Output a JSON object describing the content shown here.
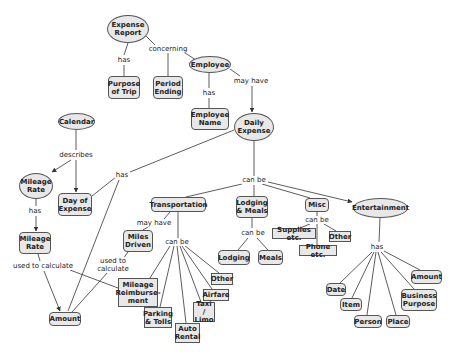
{
  "diagram": {
    "colors": {
      "node_fill": "#e8e8e8",
      "node_border": "#555555",
      "line": "#333333",
      "background": "#ffffff"
    },
    "nodes": [
      {
        "id": "expense_report",
        "label": "Expense\nReport",
        "shape": "oval",
        "x": 107,
        "y": 15,
        "w": 42,
        "h": 28
      },
      {
        "id": "purpose_of_trip",
        "label": "Purpose\nof Trip",
        "shape": "round",
        "x": 108,
        "y": 76,
        "w": 32,
        "h": 23
      },
      {
        "id": "period_ending",
        "label": "Period\nEnding",
        "shape": "round",
        "x": 153,
        "y": 76,
        "w": 30,
        "h": 23
      },
      {
        "id": "employee",
        "label": "Employee",
        "shape": "oval",
        "x": 189,
        "y": 56,
        "w": 42,
        "h": 17
      },
      {
        "id": "employee_name",
        "label": "Employee\nName",
        "shape": "round",
        "x": 191,
        "y": 108,
        "w": 38,
        "h": 22
      },
      {
        "id": "daily_expense",
        "label": "Daily\nExpense",
        "shape": "oval",
        "x": 234,
        "y": 113,
        "w": 40,
        "h": 28
      },
      {
        "id": "calendar",
        "label": "Calendar",
        "shape": "oval",
        "x": 58,
        "y": 113,
        "w": 37,
        "h": 17
      },
      {
        "id": "mileage_rate_oval",
        "label": "Mileage\nRate",
        "shape": "oval",
        "x": 19,
        "y": 173,
        "w": 34,
        "h": 26
      },
      {
        "id": "day_of_expense",
        "label": "Day of\nExpense",
        "shape": "round",
        "x": 58,
        "y": 193,
        "w": 34,
        "h": 23
      },
      {
        "id": "mileage_rate_box",
        "label": "Mileage\nRate",
        "shape": "round",
        "x": 19,
        "y": 232,
        "w": 32,
        "h": 22
      },
      {
        "id": "amount_left",
        "label": "Amount",
        "shape": "round",
        "x": 49,
        "y": 312,
        "w": 32,
        "h": 14
      },
      {
        "id": "transportation",
        "label": "Transportation",
        "shape": "round",
        "x": 151,
        "y": 197,
        "w": 55,
        "h": 15
      },
      {
        "id": "miles_driven",
        "label": "Miles\nDriven",
        "shape": "round",
        "x": 123,
        "y": 230,
        "w": 30,
        "h": 22
      },
      {
        "id": "mileage_reimbursement",
        "label": "Mileage\nReimburse-\nment",
        "shape": "square",
        "x": 118,
        "y": 278,
        "w": 40,
        "h": 29
      },
      {
        "id": "parking_tolls",
        "label": "Parking\n& Tolls",
        "shape": "square",
        "x": 144,
        "y": 307,
        "w": 28,
        "h": 21
      },
      {
        "id": "auto_rental",
        "label": "Auto\nRental",
        "shape": "square",
        "x": 175,
        "y": 323,
        "w": 25,
        "h": 20
      },
      {
        "id": "taxi_limo",
        "label": "Taxi /\nLimo",
        "shape": "square",
        "x": 193,
        "y": 302,
        "w": 22,
        "h": 20
      },
      {
        "id": "airfare",
        "label": "Airfare",
        "shape": "square",
        "x": 203,
        "y": 289,
        "w": 26,
        "h": 12
      },
      {
        "id": "other_transport",
        "label": "Other",
        "shape": "square",
        "x": 211,
        "y": 273,
        "w": 22,
        "h": 12
      },
      {
        "id": "lodging_meals",
        "label": "Lodging\n& Meals",
        "shape": "round",
        "x": 236,
        "y": 196,
        "w": 32,
        "h": 22
      },
      {
        "id": "lodging",
        "label": "Lodging",
        "shape": "round",
        "x": 218,
        "y": 250,
        "w": 32,
        "h": 15
      },
      {
        "id": "meals",
        "label": "Meals",
        "shape": "round",
        "x": 258,
        "y": 250,
        "w": 25,
        "h": 15
      },
      {
        "id": "misc",
        "label": "Misc",
        "shape": "round",
        "x": 305,
        "y": 198,
        "w": 24,
        "h": 14
      },
      {
        "id": "supplies",
        "label": "Supplies etc.",
        "shape": "square",
        "x": 272,
        "y": 228,
        "w": 44,
        "h": 11
      },
      {
        "id": "phone",
        "label": "Phone etc.",
        "shape": "square",
        "x": 299,
        "y": 245,
        "w": 38,
        "h": 11
      },
      {
        "id": "other_misc",
        "label": "Other",
        "shape": "square",
        "x": 329,
        "y": 231,
        "w": 22,
        "h": 11
      },
      {
        "id": "entertainment",
        "label": "Entertainment",
        "shape": "oval",
        "x": 353,
        "y": 198,
        "w": 55,
        "h": 20
      },
      {
        "id": "date",
        "label": "Date",
        "shape": "round",
        "x": 326,
        "y": 283,
        "w": 20,
        "h": 13
      },
      {
        "id": "item",
        "label": "Item",
        "shape": "round",
        "x": 340,
        "y": 298,
        "w": 22,
        "h": 13
      },
      {
        "id": "person",
        "label": "Person",
        "shape": "round",
        "x": 354,
        "y": 315,
        "w": 28,
        "h": 13
      },
      {
        "id": "place",
        "label": "Place",
        "shape": "round",
        "x": 386,
        "y": 315,
        "w": 24,
        "h": 13
      },
      {
        "id": "business_purpose",
        "label": "Business\nPurpose",
        "shape": "round",
        "x": 401,
        "y": 289,
        "w": 36,
        "h": 22
      },
      {
        "id": "amount_right",
        "label": "Amount",
        "shape": "round",
        "x": 411,
        "y": 270,
        "w": 31,
        "h": 14
      }
    ],
    "link_labels": [
      {
        "id": "lbl_has_1",
        "text": "has",
        "x": 124,
        "y": 60
      },
      {
        "id": "lbl_concerning",
        "text": "concerning",
        "x": 168,
        "y": 49
      },
      {
        "id": "lbl_has_2",
        "text": "has",
        "x": 209,
        "y": 93
      },
      {
        "id": "lbl_may_have_1",
        "text": "may have",
        "x": 251,
        "y": 81
      },
      {
        "id": "lbl_describes",
        "text": "describes",
        "x": 76,
        "y": 155
      },
      {
        "id": "lbl_has_3",
        "text": "has",
        "x": 122,
        "y": 175
      },
      {
        "id": "lbl_has_4",
        "text": "has",
        "x": 35,
        "y": 211
      },
      {
        "id": "lbl_used_to_calc_1",
        "text": "used to calculate",
        "x": 43,
        "y": 266
      },
      {
        "id": "lbl_can_be_1",
        "text": "can be",
        "x": 254,
        "y": 180
      },
      {
        "id": "lbl_may_have_2",
        "text": "may have",
        "x": 154,
        "y": 223
      },
      {
        "id": "lbl_used_to_calc_2",
        "text": "used to\ncalculate",
        "x": 113,
        "y": 265
      },
      {
        "id": "lbl_can_be_2",
        "text": "can be",
        "x": 177,
        "y": 242
      },
      {
        "id": "lbl_can_be_3",
        "text": "can be",
        "x": 253,
        "y": 233
      },
      {
        "id": "lbl_can_be_4",
        "text": "can be",
        "x": 317,
        "y": 220
      },
      {
        "id": "lbl_has_5",
        "text": "has",
        "x": 377,
        "y": 247
      }
    ],
    "edges": [
      {
        "from": [
          128,
          43
        ],
        "to": [
          124,
          55
        ]
      },
      {
        "from": [
          124,
          65
        ],
        "to": [
          124,
          76
        ]
      },
      {
        "from": [
          146,
          36
        ],
        "to": [
          155,
          45
        ]
      },
      {
        "from": [
          182,
          51
        ],
        "to": [
          196,
          60
        ]
      },
      {
        "from": [
          168,
          53
        ],
        "to": [
          168,
          76
        ]
      },
      {
        "from": [
          209,
          73
        ],
        "to": [
          209,
          88
        ]
      },
      {
        "from": [
          209,
          98
        ],
        "to": [
          209,
          108
        ]
      },
      {
        "from": [
          230,
          69
        ],
        "to": [
          240,
          76
        ]
      },
      {
        "from": [
          252,
          86
        ],
        "to": [
          252,
          112
        ],
        "arrow": true
      },
      {
        "from": [
          76,
          130
        ],
        "to": [
          76,
          150
        ]
      },
      {
        "from": [
          71,
          160
        ],
        "to": [
          52,
          172
        ],
        "arrow": true
      },
      {
        "from": [
          76,
          160
        ],
        "to": [
          76,
          192
        ],
        "arrow": true
      },
      {
        "from": [
          234,
          130
        ],
        "to": [
          130,
          172
        ]
      },
      {
        "from": [
          116,
          177
        ],
        "to": [
          92,
          196
        ]
      },
      {
        "from": [
          119,
          180
        ],
        "to": [
          68,
          311
        ]
      },
      {
        "from": [
          36,
          199
        ],
        "to": [
          36,
          206
        ]
      },
      {
        "from": [
          36,
          216
        ],
        "to": [
          36,
          231
        ],
        "arrow": true
      },
      {
        "from": [
          38,
          254
        ],
        "to": [
          40,
          261
        ]
      },
      {
        "from": [
          44,
          271
        ],
        "to": [
          60,
          311
        ],
        "arrow": true
      },
      {
        "from": [
          70,
          270
        ],
        "to": [
          118,
          288
        ]
      },
      {
        "from": [
          254,
          141
        ],
        "to": [
          254,
          176
        ]
      },
      {
        "from": [
          242,
          184
        ],
        "to": [
          186,
          197
        ]
      },
      {
        "from": [
          254,
          185
        ],
        "to": [
          254,
          196
        ]
      },
      {
        "from": [
          262,
          184
        ],
        "to": [
          310,
          198
        ]
      },
      {
        "from": [
          268,
          182
        ],
        "to": [
          352,
          202
        ],
        "arrow": true
      },
      {
        "from": [
          170,
          212
        ],
        "to": [
          164,
          219
        ]
      },
      {
        "from": [
          148,
          227
        ],
        "to": [
          143,
          230
        ]
      },
      {
        "from": [
          178,
          212
        ],
        "to": [
          178,
          238
        ]
      },
      {
        "from": [
          128,
          252
        ],
        "to": [
          123,
          259
        ]
      },
      {
        "from": [
          108,
          272
        ],
        "to": [
          72,
          312
        ]
      },
      {
        "from": [
          170,
          246
        ],
        "to": [
          150,
          278
        ]
      },
      {
        "from": [
          174,
          246
        ],
        "to": [
          160,
          307
        ]
      },
      {
        "from": [
          177,
          246
        ],
        "to": [
          186,
          323
        ]
      },
      {
        "from": [
          180,
          246
        ],
        "to": [
          201,
          302
        ]
      },
      {
        "from": [
          182,
          246
        ],
        "to": [
          212,
          289
        ]
      },
      {
        "from": [
          184,
          245
        ],
        "to": [
          219,
          273
        ]
      },
      {
        "from": [
          252,
          218
        ],
        "to": [
          252,
          228
        ]
      },
      {
        "from": [
          248,
          238
        ],
        "to": [
          238,
          250
        ]
      },
      {
        "from": [
          257,
          238
        ],
        "to": [
          268,
          250
        ]
      },
      {
        "from": [
          317,
          212
        ],
        "to": [
          317,
          216
        ]
      },
      {
        "from": [
          310,
          224
        ],
        "to": [
          300,
          228
        ]
      },
      {
        "from": [
          317,
          224
        ],
        "to": [
          317,
          245
        ]
      },
      {
        "from": [
          324,
          224
        ],
        "to": [
          336,
          231
        ]
      },
      {
        "from": [
          380,
          218
        ],
        "to": [
          379,
          242
        ]
      },
      {
        "from": [
          372,
          252
        ],
        "to": [
          340,
          283
        ]
      },
      {
        "from": [
          374,
          252
        ],
        "to": [
          352,
          298
        ]
      },
      {
        "from": [
          376,
          252
        ],
        "to": [
          367,
          315
        ]
      },
      {
        "from": [
          378,
          252
        ],
        "to": [
          396,
          315
        ]
      },
      {
        "from": [
          381,
          252
        ],
        "to": [
          414,
          289
        ]
      },
      {
        "from": [
          384,
          251
        ],
        "to": [
          420,
          270
        ]
      }
    ]
  }
}
